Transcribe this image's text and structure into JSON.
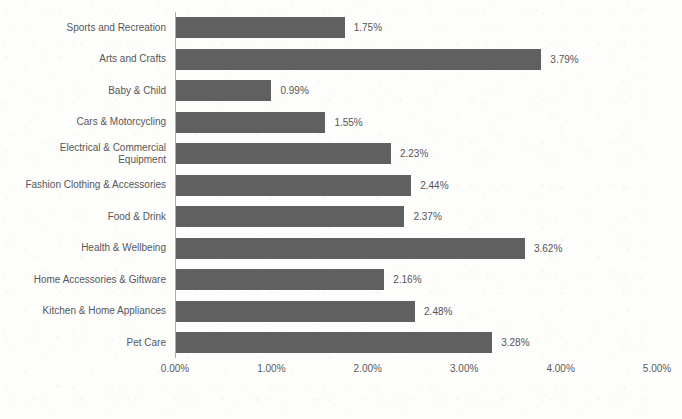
{
  "chart_data": {
    "type": "bar",
    "orientation": "horizontal",
    "title": "",
    "subtitle": "",
    "xlabel": "",
    "ylabel": "",
    "xlim": [
      0,
      5
    ],
    "xtick_labels": [
      "0.00%",
      "1.00%",
      "2.00%",
      "3.00%",
      "4.00%",
      "5.00%"
    ],
    "xtick_values": [
      0,
      1,
      2,
      3,
      4,
      5
    ],
    "grid": false,
    "legend": false,
    "value_suffix": "%",
    "bar_color": "#606060",
    "axis_color": "#adadad",
    "label_color": "#575757",
    "categories": [
      "Sports and Recreation",
      "Arts and Crafts",
      "Baby & Child",
      "Cars & Motorcycling",
      "Electrical & Commercial\nEquipment",
      "Fashion Clothing & Accessories",
      "Food & Drink",
      "Health & Wellbeing",
      "Home Accessories & Giftware",
      "Kitchen & Home Appliances",
      "Pet Care"
    ],
    "values": [
      1.75,
      3.79,
      0.99,
      1.55,
      2.23,
      2.44,
      2.37,
      3.62,
      2.16,
      2.48,
      3.28
    ],
    "value_labels": [
      "1.75%",
      "3.79%",
      "0.99%",
      "1.55%",
      "2.23%",
      "2.44%",
      "2.37%",
      "3.62%",
      "2.16%",
      "2.48%",
      "3.28%"
    ]
  }
}
